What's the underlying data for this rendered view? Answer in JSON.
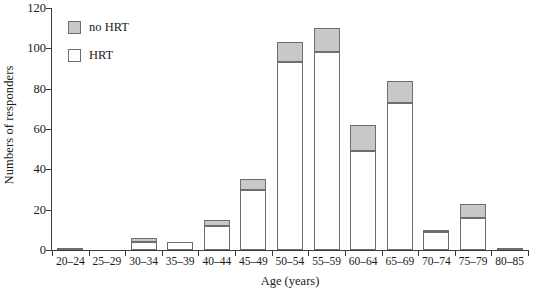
{
  "chart_data": {
    "type": "bar",
    "stacked": true,
    "title": "",
    "xlabel": "Age (years)",
    "ylabel": "Numbers of responders",
    "categories": [
      "20–24",
      "25–29",
      "30–34",
      "35–39",
      "40–44",
      "45–49",
      "50–54",
      "55–59",
      "60–64",
      "65–69",
      "70–74",
      "75–79",
      "80–85"
    ],
    "series": [
      {
        "name": "HRT",
        "color": "#ffffff",
        "values": [
          0,
          0,
          4,
          4,
          12,
          30,
          93,
          98,
          49,
          73,
          9,
          16,
          0
        ]
      },
      {
        "name": "no HRT",
        "color": "#c8c8c8",
        "values": [
          1,
          0,
          2,
          0,
          3,
          5,
          10,
          12,
          13,
          11,
          1,
          7,
          1
        ]
      }
    ],
    "totals": [
      1,
      0,
      6,
      4,
      15,
      35,
      103,
      110,
      62,
      84,
      10,
      23,
      1
    ],
    "ylim": [
      0,
      120
    ],
    "yticks": [
      0,
      20,
      40,
      60,
      80,
      100,
      120
    ],
    "ytick_labels": [
      "0",
      "20",
      "40",
      "60",
      "80",
      "100",
      "120"
    ],
    "grid": false,
    "legend_position": "top-left",
    "legend": [
      {
        "label": "no HRT",
        "color": "#c8c8c8"
      },
      {
        "label": "HRT",
        "color": "#ffffff"
      }
    ]
  }
}
